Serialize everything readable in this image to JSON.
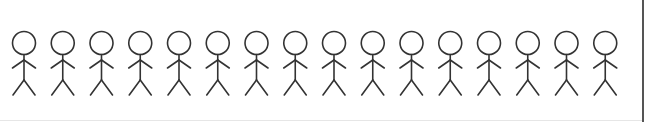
{
  "diagram": {
    "type": "pictogram",
    "figure_count": 16,
    "figure_icon": "stick-figure-icon",
    "stroke_color": "#333333",
    "border_color": "#555555",
    "first_center_x": 24,
    "spacing_x": 38.75,
    "head": {
      "cy": 43,
      "r": 11.5
    },
    "neck_y": 54.5,
    "arm_junction_y": 60,
    "arm_end_y": 68,
    "arm_half_width": 11.5,
    "hip_y": 80,
    "leg_end_y": 95,
    "leg_half_width": 11
  }
}
